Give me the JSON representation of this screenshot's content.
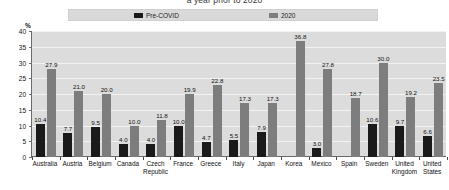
{
  "chart_data": {
    "type": "bar",
    "title": "a year prior to 2020",
    "xlabel": "",
    "ylabel": "%",
    "ylim": [
      0,
      40
    ],
    "yticks": [
      0,
      5,
      10,
      15,
      20,
      25,
      30,
      35,
      40
    ],
    "grid": true,
    "legend_position": "top",
    "categories": [
      "Australia",
      "Austria",
      "Belgium",
      "Canada",
      "Czech\nRepublic",
      "France",
      "Greece",
      "Italy",
      "Japan",
      "Korea",
      "Mexico",
      "Spain",
      "Sweden",
      "United\nKingdom",
      "United\nStates"
    ],
    "series": [
      {
        "name": "Pre-COVID",
        "color": "#1a1a1a",
        "values": [
          10.4,
          7.7,
          9.5,
          4.0,
          4.0,
          10.0,
          4.7,
          5.5,
          7.9,
          null,
          3.0,
          null,
          10.6,
          9.7,
          6.6
        ],
        "labels": [
          "10.4",
          "7.7",
          "9.5",
          "4.0",
          "4.0",
          "10.0",
          "4.7",
          "5.5",
          "7.9",
          "",
          "3.0",
          "",
          "10.6",
          "9.7",
          "6.6"
        ]
      },
      {
        "name": "2020",
        "color": "#7d7d7d",
        "values": [
          27.9,
          21.0,
          20.0,
          10.0,
          11.8,
          19.9,
          22.8,
          17.3,
          17.3,
          36.8,
          27.8,
          18.7,
          30.0,
          19.2,
          23.5
        ],
        "labels": [
          "27.9",
          "21.0",
          "20.0",
          "10.0",
          "11.8",
          "19.9",
          "22.8",
          "17.3",
          "17.3",
          "36.8",
          "27.8",
          "18.7",
          "30.0",
          "19.2",
          "23.5"
        ]
      }
    ]
  },
  "legend": {
    "items": [
      {
        "label": "Pre-COVID",
        "color": "#1a1a1a"
      },
      {
        "label": "2020",
        "color": "#7d7d7d"
      }
    ]
  },
  "axis": {
    "unit_label": "%"
  }
}
